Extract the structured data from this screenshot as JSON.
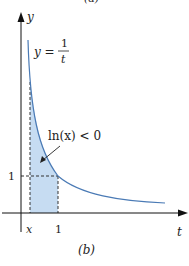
{
  "figure": {
    "top_caption_partial": "(a)",
    "caption": "(b)",
    "axes": {
      "x_label": "t",
      "y_label": "y"
    },
    "curve_label": {
      "lhs": "y =",
      "numerator": "1",
      "denominator": "t"
    },
    "annotation": "ln(x) < 0",
    "ticks": {
      "x_tick_x": "x",
      "x_tick_one": "1",
      "y_tick_one": "1"
    },
    "colors": {
      "curve": "#4a7ab5",
      "fill": "#c6dcf2",
      "axis": "#111111",
      "dashed": "#333333"
    }
  }
}
